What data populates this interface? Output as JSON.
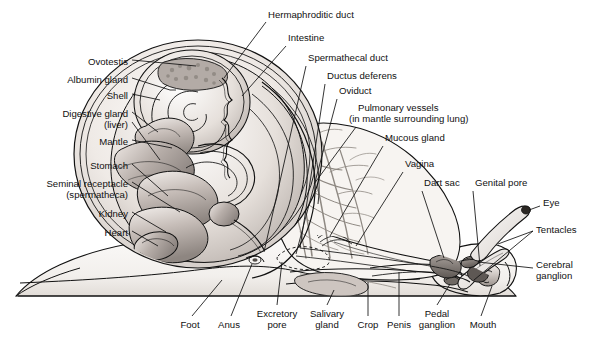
{
  "figure": {
    "style": "grayscale biological illustration with leader-line callouts",
    "background_color": "#ffffff",
    "line_color": "#111111",
    "tissue_fill_light": "#f2efec",
    "tissue_fill_mid": "#bdb5b1",
    "tissue_fill_dark": "#8d8581",
    "vessel_color": "#8a8a8a"
  },
  "labels": {
    "left": [
      {
        "text": "Ovotestis",
        "x": 128,
        "y": 62,
        "lines": 1
      },
      {
        "text": "Albumin gland",
        "x": 128,
        "y": 80,
        "lines": 1
      },
      {
        "text": "Shell",
        "x": 128,
        "y": 96,
        "lines": 1
      },
      {
        "text": "Digestive gland",
        "x": 128,
        "y": 114,
        "lines": 1
      },
      {
        "text": "(liver)",
        "x": 128,
        "y": 125,
        "lines": 1
      },
      {
        "text": "Mantle",
        "x": 128,
        "y": 142,
        "lines": 1
      },
      {
        "text": "Stomach",
        "x": 128,
        "y": 166,
        "lines": 1
      },
      {
        "text": "Seminal receptacle",
        "x": 128,
        "y": 184,
        "lines": 1
      },
      {
        "text": "(spermatheca)",
        "x": 128,
        "y": 195,
        "lines": 1
      },
      {
        "text": "Kidney",
        "x": 128,
        "y": 214,
        "lines": 1
      },
      {
        "text": "Heart",
        "x": 128,
        "y": 233,
        "lines": 1
      }
    ],
    "top": [
      {
        "text": "Hermaphroditic duct",
        "x": 268,
        "y": 15
      },
      {
        "text": "Intestine",
        "x": 288,
        "y": 38
      },
      {
        "text": "Spermathecal duct",
        "x": 308,
        "y": 58
      },
      {
        "text": "Ductus deferens",
        "x": 327,
        "y": 76
      },
      {
        "text": "Oviduct",
        "x": 339,
        "y": 91
      },
      {
        "text": "Pulmonary vessels",
        "x": 358,
        "y": 108
      },
      {
        "text": "(in mantle surrounding lung)",
        "x": 349,
        "y": 119
      },
      {
        "text": "Mucous gland",
        "x": 385,
        "y": 138
      },
      {
        "text": "Vagina",
        "x": 405,
        "y": 164
      },
      {
        "text": "Dart sac",
        "x": 424,
        "y": 183
      },
      {
        "text": "Genital pore",
        "x": 475,
        "y": 183
      }
    ],
    "right": [
      {
        "text": "Eye",
        "x": 543,
        "y": 203
      },
      {
        "text": "Tentacles",
        "x": 536,
        "y": 230
      },
      {
        "text": "Cerebral",
        "x": 536,
        "y": 265
      },
      {
        "text": "ganglion",
        "x": 536,
        "y": 276
      }
    ],
    "bottom": [
      {
        "text": "Foot",
        "x": 190,
        "y": 325,
        "align": "center"
      },
      {
        "text": "Anus",
        "x": 229,
        "y": 325,
        "align": "center"
      },
      {
        "text": "Excretory",
        "x": 277,
        "y": 314,
        "align": "center"
      },
      {
        "text": "pore",
        "x": 277,
        "y": 325,
        "align": "center"
      },
      {
        "text": "Salivary",
        "x": 327,
        "y": 314,
        "align": "center"
      },
      {
        "text": "gland",
        "x": 327,
        "y": 325,
        "align": "center"
      },
      {
        "text": "Crop",
        "x": 368,
        "y": 325,
        "align": "center"
      },
      {
        "text": "Penis",
        "x": 399,
        "y": 325,
        "align": "center"
      },
      {
        "text": "Pedal",
        "x": 437,
        "y": 314,
        "align": "center"
      },
      {
        "text": "ganglion",
        "x": 437,
        "y": 325,
        "align": "center"
      },
      {
        "text": "Mouth",
        "x": 483,
        "y": 325,
        "align": "center"
      }
    ]
  },
  "structures": [
    "shell",
    "ovotestis",
    "albumin gland",
    "digestive gland (liver)",
    "mantle",
    "stomach",
    "seminal receptacle (spermatheca)",
    "kidney",
    "heart",
    "hermaphroditic duct",
    "intestine",
    "spermathecal duct",
    "ductus deferens",
    "oviduct",
    "pulmonary vessels",
    "mucous gland",
    "vagina",
    "dart sac",
    "genital pore",
    "eye",
    "tentacles",
    "cerebral ganglion",
    "pedal ganglion",
    "mouth",
    "penis",
    "crop",
    "salivary gland",
    "excretory pore",
    "anus",
    "foot"
  ]
}
